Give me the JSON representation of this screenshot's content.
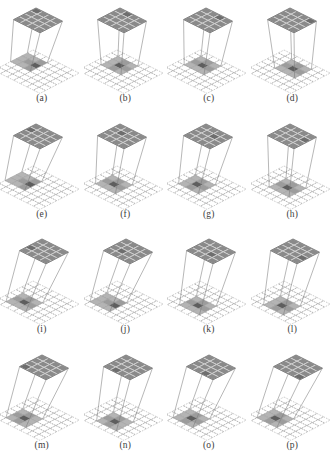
{
  "figure": {
    "type": "diagram-grid",
    "columns": 4,
    "rows": 4,
    "background_color": "#ffffff"
  },
  "colors": {
    "top_grid_fill": "#8a8a8a",
    "top_grid_line": "#d8d8d8",
    "top_grid_edge": "#5d5d5d",
    "bottom_grid_line": "#9a9a9a",
    "receptive_light": "#b4b4b4",
    "receptive_mid": "#9c9c9c",
    "receptive_dark": "#5e5e5e",
    "projection_line": "#7a7a7a",
    "caption_color": "#3b3b3b"
  },
  "grids": {
    "top_cols": 4,
    "top_rows": 4,
    "bottom_cols": 7,
    "bottom_rows": 7
  },
  "panels": [
    {
      "id": "a",
      "caption": "(a)",
      "top_anchor": [
        0,
        0
      ],
      "field_origin": [
        0,
        1
      ],
      "field_size": [
        3,
        3
      ],
      "dark_cells": [
        [
          2,
          2
        ]
      ],
      "mid_cells": [
        [
          1,
          2
        ],
        [
          2,
          3
        ],
        [
          2,
          1
        ]
      ],
      "spread": "narrow",
      "lines": 4
    },
    {
      "id": "b",
      "caption": "(b)",
      "top_anchor": [
        1,
        0
      ],
      "field_origin": [
        1,
        1
      ],
      "field_size": [
        3,
        3
      ],
      "dark_cells": [
        [
          2,
          2
        ]
      ],
      "mid_cells": [
        [
          2,
          1
        ],
        [
          3,
          2
        ],
        [
          2,
          3
        ]
      ],
      "spread": "narrow",
      "lines": 4
    },
    {
      "id": "c",
      "caption": "(c)",
      "top_anchor": [
        2,
        0
      ],
      "field_origin": [
        1,
        1
      ],
      "field_size": [
        3,
        3
      ],
      "dark_cells": [
        [
          2,
          2
        ]
      ],
      "mid_cells": [
        [
          2,
          1
        ],
        [
          1,
          2
        ],
        [
          3,
          2
        ]
      ],
      "spread": "medium",
      "lines": 4
    },
    {
      "id": "d",
      "caption": "(d)",
      "top_anchor": [
        3,
        0
      ],
      "field_origin": [
        2,
        1
      ],
      "field_size": [
        3,
        3
      ],
      "dark_cells": [
        [
          3,
          2
        ]
      ],
      "mid_cells": [
        [
          2,
          2
        ],
        [
          3,
          1
        ],
        [
          4,
          2
        ]
      ],
      "spread": "medium",
      "lines": 4
    },
    {
      "id": "e",
      "caption": "(e)",
      "top_anchor": [
        0,
        1
      ],
      "field_origin": [
        0,
        2
      ],
      "field_size": [
        3,
        3
      ],
      "dark_cells": [
        [
          2,
          3
        ]
      ],
      "mid_cells": [
        [
          1,
          3
        ],
        [
          2,
          2
        ],
        [
          2,
          4
        ]
      ],
      "spread": "narrow",
      "lines": 4
    },
    {
      "id": "f",
      "caption": "(f)",
      "top_anchor": [
        1,
        1
      ],
      "field_origin": [
        1,
        2
      ],
      "field_size": [
        3,
        3
      ],
      "dark_cells": [
        [
          2,
          3
        ]
      ],
      "mid_cells": [
        [
          2,
          2
        ],
        [
          1,
          3
        ],
        [
          3,
          3
        ]
      ],
      "spread": "narrow",
      "lines": 4
    },
    {
      "id": "g",
      "caption": "(g)",
      "top_anchor": [
        2,
        1
      ],
      "field_origin": [
        1,
        2
      ],
      "field_size": [
        3,
        3
      ],
      "dark_cells": [
        [
          2,
          3
        ]
      ],
      "mid_cells": [
        [
          2,
          2
        ],
        [
          3,
          3
        ],
        [
          2,
          4
        ]
      ],
      "spread": "medium",
      "lines": 4
    },
    {
      "id": "h",
      "caption": "(h)",
      "top_anchor": [
        3,
        1
      ],
      "field_origin": [
        2,
        2
      ],
      "field_size": [
        3,
        3
      ],
      "dark_cells": [
        [
          3,
          3
        ]
      ],
      "mid_cells": [
        [
          2,
          3
        ],
        [
          3,
          2
        ],
        [
          4,
          3
        ]
      ],
      "spread": "medium",
      "lines": 4
    },
    {
      "id": "i",
      "caption": "(i)",
      "top_anchor": [
        0,
        2
      ],
      "field_origin": [
        1,
        3
      ],
      "field_size": [
        3,
        3
      ],
      "dark_cells": [
        [
          2,
          4
        ]
      ],
      "mid_cells": [
        [
          1,
          4
        ],
        [
          2,
          3
        ],
        [
          3,
          4
        ]
      ],
      "spread": "wide",
      "lines": 4
    },
    {
      "id": "j",
      "caption": "(j)",
      "top_anchor": [
        1,
        2
      ],
      "field_origin": [
        1,
        3
      ],
      "field_size": [
        3,
        3
      ],
      "dark_cells": [
        [
          3,
          4
        ]
      ],
      "mid_cells": [
        [
          2,
          4
        ],
        [
          3,
          3
        ],
        [
          4,
          4
        ]
      ],
      "spread": "wide",
      "lines": 4
    },
    {
      "id": "k",
      "caption": "(k)",
      "top_anchor": [
        2,
        2
      ],
      "field_origin": [
        2,
        3
      ],
      "field_size": [
        3,
        3
      ],
      "dark_cells": [
        [
          3,
          4
        ]
      ],
      "mid_cells": [
        [
          2,
          4
        ],
        [
          3,
          3
        ],
        [
          4,
          4
        ]
      ],
      "spread": "wide",
      "lines": 4
    },
    {
      "id": "l",
      "caption": "(l)",
      "top_anchor": [
        3,
        2
      ],
      "field_origin": [
        2,
        3
      ],
      "field_size": [
        3,
        3
      ],
      "dark_cells": [
        [
          3,
          4
        ]
      ],
      "mid_cells": [
        [
          3,
          3
        ],
        [
          4,
          4
        ],
        [
          3,
          5
        ]
      ],
      "spread": "wide",
      "lines": 4
    },
    {
      "id": "m",
      "caption": "(m)",
      "top_anchor": [
        0,
        3
      ],
      "field_origin": [
        1,
        3
      ],
      "field_size": [
        3,
        3
      ],
      "dark_cells": [
        [
          2,
          4
        ]
      ],
      "mid_cells": [
        [
          1,
          4
        ],
        [
          2,
          3
        ],
        [
          2,
          5
        ]
      ],
      "spread": "wide",
      "lines": 4
    },
    {
      "id": "n",
      "caption": "(n)",
      "top_anchor": [
        1,
        3
      ],
      "field_origin": [
        2,
        3
      ],
      "field_size": [
        3,
        3
      ],
      "dark_cells": [
        [
          3,
          4
        ]
      ],
      "mid_cells": [
        [
          2,
          4
        ],
        [
          3,
          3
        ],
        [
          3,
          5
        ]
      ],
      "spread": "wide",
      "lines": 4
    },
    {
      "id": "o",
      "caption": "(o)",
      "top_anchor": [
        2,
        3
      ],
      "field_origin": [
        1,
        3
      ],
      "field_size": [
        3,
        3
      ],
      "dark_cells": [
        [
          2,
          4
        ]
      ],
      "mid_cells": [
        [
          2,
          3
        ],
        [
          3,
          4
        ],
        [
          2,
          5
        ]
      ],
      "spread": "wide",
      "lines": 4
    },
    {
      "id": "p",
      "caption": "(p)",
      "top_anchor": [
        3,
        3
      ],
      "field_origin": [
        1,
        3
      ],
      "field_size": [
        3,
        3
      ],
      "dark_cells": [
        [
          2,
          4
        ]
      ],
      "mid_cells": [
        [
          2,
          3
        ],
        [
          3,
          4
        ],
        [
          2,
          5
        ]
      ],
      "spread": "widest",
      "lines": 4
    }
  ]
}
